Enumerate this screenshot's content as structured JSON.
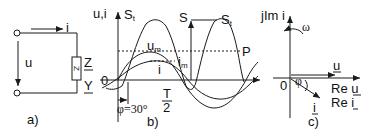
{
  "panel_a": {
    "caption": "a)",
    "current_label": "i",
    "voltage_label": "u",
    "impedance_label": "Z",
    "admittance_label": "Y",
    "element_symbol": "Z"
  },
  "panel_b": {
    "caption": "b)",
    "y_axis_label": "u,i",
    "origin_label": "0",
    "instant_power_label": "S",
    "instant_power_sub": "t",
    "instant_power_label_right": "S",
    "instant_power_sub_right": "t",
    "apparent_power_label": "S",
    "active_power_label": "P",
    "voltage_amp_label": "u",
    "voltage_amp_sub": "m",
    "current_amp_label": "i",
    "current_amp_sub": "m",
    "current_label": "i",
    "phase_label": "φ=30°",
    "half_period_num": "T",
    "half_period_den": "2"
  },
  "panel_c": {
    "caption": "c)",
    "imag_axis_label": "jIm i",
    "omega_label": "ω",
    "origin_label": "0",
    "voltage_phasor_label": "u",
    "current_phasor_label": "i",
    "phi_label": "φ",
    "re_u_label": "Re u",
    "re_i_label": "Re i"
  },
  "colors": {
    "stroke": "#1a1a1a",
    "background": "#ffffff"
  }
}
